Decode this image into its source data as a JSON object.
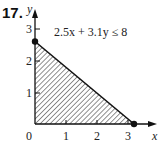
{
  "problem_number": "17.",
  "inequality": "2.5x + 3.1y ≤ 8",
  "axes": {
    "x_label": "x",
    "y_label": "y",
    "x_ticks": [
      "0",
      "1",
      "2",
      "3"
    ],
    "y_ticks": [
      "1",
      "2",
      "3"
    ]
  },
  "region": {
    "vertices": [
      [
        0,
        0
      ],
      [
        0,
        2.58
      ],
      [
        3.2,
        0
      ]
    ],
    "fill": "hatched",
    "intercept_points": [
      [
        0,
        2.58
      ],
      [
        3.2,
        0
      ]
    ]
  },
  "colors": {
    "ink": "#111111",
    "background": "#ffffff"
  }
}
